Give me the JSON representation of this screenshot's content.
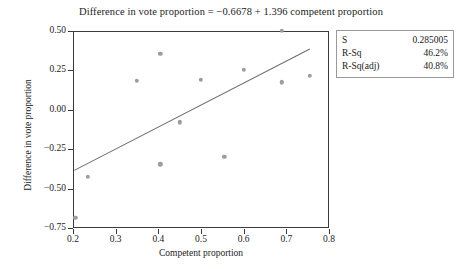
{
  "chart_data": {
    "type": "scatter",
    "title": "Difference in vote proportion =  −0.6678 + 1.396 competent proportion",
    "xlabel": "Competent proportion",
    "ylabel": "Difference in vote proportion",
    "xlim": [
      0.2,
      0.8
    ],
    "ylim": [
      -0.75,
      0.5
    ],
    "xticks": [
      "0.2",
      "0.3",
      "0.4",
      "0.5",
      "0.6",
      "0.7",
      "0.8"
    ],
    "xtick_values": [
      0.2,
      0.3,
      0.4,
      0.5,
      0.6,
      0.7,
      0.8
    ],
    "yticks": [
      "0.50",
      "0.25",
      "0.00",
      "−0.25",
      "−0.50",
      "−0.75"
    ],
    "ytick_values": [
      0.5,
      0.25,
      0.0,
      -0.25,
      -0.5,
      -0.75
    ],
    "grid": false,
    "legend": false,
    "marker_color": "#9d9d9d",
    "line_color": "#6e6e6e",
    "points": [
      {
        "x": 0.205,
        "y": -0.685
      },
      {
        "x": 0.235,
        "y": -0.425
      },
      {
        "x": 0.35,
        "y": 0.185
      },
      {
        "x": 0.405,
        "y": 0.355
      },
      {
        "x": 0.405,
        "y": -0.345
      },
      {
        "x": 0.45,
        "y": -0.08
      },
      {
        "x": 0.5,
        "y": 0.19
      },
      {
        "x": 0.555,
        "y": -0.3
      },
      {
        "x": 0.6,
        "y": 0.255
      },
      {
        "x": 0.69,
        "y": 0.5
      },
      {
        "x": 0.69,
        "y": 0.175
      },
      {
        "x": 0.755,
        "y": 0.215
      }
    ],
    "fit_line": {
      "intercept": -0.6678,
      "slope": 1.396,
      "x_start": 0.203,
      "x_end": 0.755,
      "equation": "Difference in vote proportion =  −0.6678 + 1.396 competent proportion"
    }
  },
  "stats_box": {
    "rows": [
      {
        "key": "S",
        "value": "0.285005"
      },
      {
        "key": "R-Sq",
        "value": "46.2%"
      },
      {
        "key": "R-Sq(adj)",
        "value": "40.8%"
      }
    ]
  }
}
